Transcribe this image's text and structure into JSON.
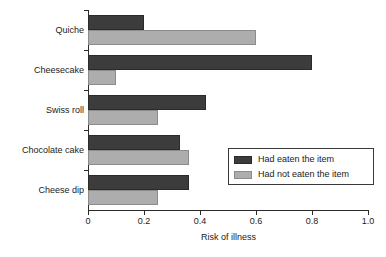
{
  "chart_data": {
    "type": "bar",
    "orientation": "horizontal",
    "title": "",
    "xlabel": "Risk of illness",
    "ylabel": "",
    "xlim": [
      0,
      1.0
    ],
    "xticks": [
      "0",
      "0.2",
      "0.4",
      "0.6",
      "0.8",
      "1.0"
    ],
    "xtick_values": [
      0,
      0.2,
      0.4,
      0.6,
      0.8,
      1.0
    ],
    "grid": false,
    "legend_position": "center-right",
    "categories": [
      "Quiche",
      "Cheesecake",
      "Swiss roll",
      "Chocolate cake",
      "Cheese dip"
    ],
    "series": [
      {
        "name": "Had eaten the item",
        "color": "#3c3c3c",
        "values": [
          0.2,
          0.8,
          0.42,
          0.33,
          0.36
        ]
      },
      {
        "name": "Had not eaten the item",
        "color": "#adadad",
        "values": [
          0.6,
          0.1,
          0.25,
          0.36,
          0.25
        ]
      }
    ]
  },
  "legend": {
    "items": [
      {
        "label": "Had eaten the item",
        "swatch": "dark"
      },
      {
        "label": "Had not eaten the item",
        "swatch": "light"
      }
    ]
  },
  "colors": {
    "eaten": "#3c3c3c",
    "not_eaten": "#adadad",
    "axis": "#2b2b2b",
    "background": "#ffffff"
  }
}
